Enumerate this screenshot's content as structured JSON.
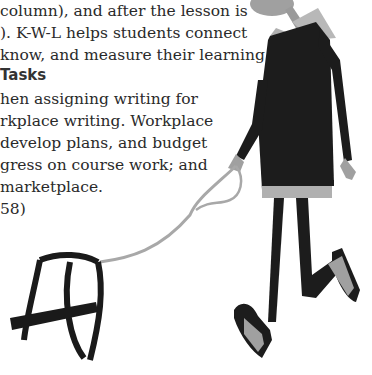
{
  "page": {
    "top_paragraph": [
      "column), and after the lesson is",
      "). K-W-L helps students connect",
      "know, and measure their learning."
    ],
    "section_heading": "Tasks",
    "tasks_paragraph": [
      "hen assigning writing for",
      "rkplace writing. Workplace",
      "develop plans, and budget",
      "gress on course work; and",
      "marketplace.",
      "58)"
    ]
  },
  "illustration": {
    "subject": "person-walking-empty-harness",
    "colors": {
      "sweater": "#1c1c1c",
      "collar": "#b8b8b8",
      "skin": "#9a9a9a",
      "leash": "#a8a8a8",
      "harness": "#1a1a1a",
      "shoe_gray": "#a0a0a0"
    }
  }
}
